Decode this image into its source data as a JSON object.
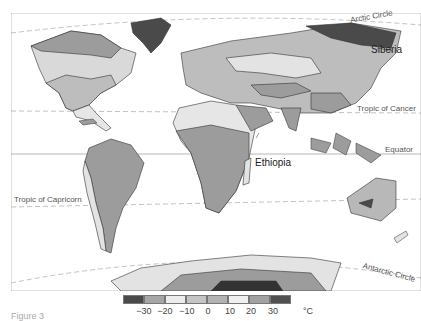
{
  "map": {
    "title": "World mean annual temperature map",
    "labels": {
      "arctic_circle": "Arctic Circle",
      "siberia": "Siberia",
      "tropic_cancer": "Tropic of Cancer",
      "equator": "Equator",
      "ethiopia": "Ethiopia",
      "tropic_capricorn": "Tropic of Capricorn",
      "antarctic_circle": "Antarctic Circle"
    }
  },
  "legend": {
    "unit": "°C",
    "ticks": [
      "−30",
      "−20",
      "−10",
      "0",
      "10",
      "20",
      "30"
    ],
    "colors": [
      "#4a4a4a",
      "#a6a6a6",
      "#ececec",
      "#c4c4c4",
      "#b2b2b2",
      "#efefef",
      "#a2a2a2",
      "#505050"
    ]
  },
  "caption": "Figure 3"
}
